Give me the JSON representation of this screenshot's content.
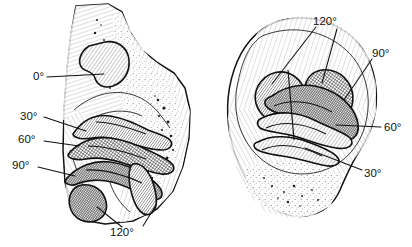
{
  "figure": {
    "background_color": "#ffffff",
    "ink_color": "#111111",
    "width": 412,
    "height": 247,
    "panels": [
      {
        "id": "left-panel",
        "name": "anterior-view-distal-femur",
        "labels": [
          {
            "id": "l-0",
            "text": "0°",
            "x": 33,
            "y": 77,
            "anchor": "start",
            "leader": [
              [
                47,
                77
              ],
              [
                104,
                74
              ]
            ]
          },
          {
            "id": "l-30",
            "text": "30°",
            "x": 20,
            "y": 117,
            "anchor": "start",
            "leader": [
              [
                44,
                117
              ],
              [
                86,
                131
              ]
            ]
          },
          {
            "id": "l-60",
            "text": "60°",
            "x": 18,
            "y": 140,
            "anchor": "start",
            "leader": [
              [
                44,
                141
              ],
              [
                79,
                146
              ]
            ]
          },
          {
            "id": "l-90",
            "text": "90°",
            "x": 12,
            "y": 166,
            "anchor": "start",
            "leader": [
              [
                38,
                167
              ],
              [
                75,
                176
              ]
            ]
          },
          {
            "id": "l-120",
            "text": "120°",
            "x": 110,
            "y": 233,
            "anchor": "start",
            "leader": [
              [
                122,
                227
              ],
              [
                97,
                207
              ]
            ]
          },
          {
            "id": "l-120b",
            "text": "",
            "x": 0,
            "y": 0,
            "anchor": "start",
            "leader": [
              [
                143,
                226
              ],
              [
                156,
                205
              ]
            ]
          }
        ]
      },
      {
        "id": "right-panel",
        "name": "distal-view-femoral-condyles",
        "labels": [
          {
            "id": "r-120",
            "text": "120°",
            "x": 313,
            "y": 22,
            "anchor": "start",
            "leader": [
              [
                316,
                27
              ],
              [
                272,
                84
              ]
            ]
          },
          {
            "id": "r-120b",
            "text": "",
            "x": 0,
            "y": 0,
            "anchor": "start",
            "leader": [
              [
                337,
                29
              ],
              [
                322,
                83
              ]
            ]
          },
          {
            "id": "r-90",
            "text": "90°",
            "x": 372,
            "y": 54,
            "anchor": "start",
            "leader": [
              [
                372,
                59
              ],
              [
                344,
                100
              ]
            ]
          },
          {
            "id": "r-60",
            "text": "60°",
            "x": 384,
            "y": 128,
            "anchor": "start",
            "leader": [
              [
                381,
                127
              ],
              [
                336,
                125
              ]
            ]
          },
          {
            "id": "r-30",
            "text": "30°",
            "x": 364,
            "y": 174,
            "anchor": "start",
            "leader": [
              [
                362,
                170
              ],
              [
                305,
                148
              ]
            ]
          }
        ]
      }
    ],
    "angle_series": [
      "0°",
      "30°",
      "60°",
      "90°",
      "120°"
    ]
  }
}
